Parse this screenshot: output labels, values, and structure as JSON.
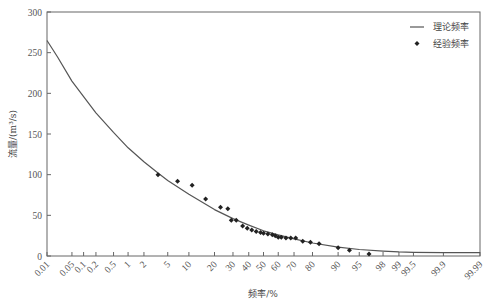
{
  "chart_data": {
    "type": "line+scatter",
    "title": "",
    "xlabel": "频率/%",
    "ylabel": "流量/(m³/s)",
    "x_scale": "probability (normal)",
    "ylim": [
      0,
      300
    ],
    "xlim": [
      0.01,
      99.99
    ],
    "grid": false,
    "legend_position": "top-right",
    "x_ticks": [
      0.01,
      0.05,
      0.1,
      0.2,
      0.5,
      1,
      2,
      5,
      10,
      20,
      30,
      40,
      50,
      60,
      70,
      80,
      90,
      95,
      98,
      99,
      99.5,
      99.9,
      99.99
    ],
    "x_tick_labels": [
      "0.01",
      "0.05",
      "0.1",
      "0.2",
      "0.5",
      "1",
      "2",
      "5",
      "10",
      "20",
      "30",
      "40",
      "50",
      "60",
      "70",
      "80",
      "90",
      "95",
      "98",
      "99",
      "99.5",
      "99.9",
      "99.99"
    ],
    "y_ticks": [
      0,
      50,
      100,
      150,
      200,
      250,
      300
    ],
    "y_tick_labels": [
      "0",
      "50",
      "100",
      "150",
      "200",
      "250",
      "300"
    ],
    "series": [
      {
        "name": "理论频率",
        "type": "line",
        "x": [
          0.01,
          0.02,
          0.05,
          0.1,
          0.2,
          0.5,
          1,
          2,
          3.5,
          5,
          10,
          20,
          30,
          40,
          50,
          60,
          70,
          80,
          90,
          95,
          98,
          99,
          99.5,
          99.9,
          99.99
        ],
        "y": [
          265,
          245,
          215,
          196,
          176,
          152,
          133,
          116,
          102,
          93,
          76,
          57,
          46,
          38,
          31,
          26,
          21,
          16,
          11,
          8,
          6,
          5,
          4.5,
          4,
          4
        ]
      },
      {
        "name": "经验频率",
        "type": "scatter",
        "x": [
          3.5,
          7,
          11,
          16,
          23,
          27,
          29,
          32,
          36,
          39,
          42,
          45,
          48,
          50,
          53,
          56,
          58,
          60,
          62,
          65,
          68,
          71,
          75,
          79,
          83,
          90,
          93,
          96.5
        ],
        "y": [
          100,
          92,
          87,
          70,
          60,
          58,
          44,
          44,
          37,
          34,
          32,
          30,
          29,
          28,
          27,
          26,
          25,
          23,
          23,
          22,
          22,
          22,
          18,
          17,
          15,
          10,
          7,
          2.5
        ]
      }
    ],
    "legend": [
      {
        "label": "理论频率",
        "marker": "line"
      },
      {
        "label": "经验频率",
        "marker": "diamond"
      }
    ]
  },
  "colors": {
    "axis": "#666666",
    "line": "#555555",
    "marker": "#222222",
    "text": "#555555"
  },
  "layout": {
    "plot_left": 47,
    "plot_right": 480,
    "plot_top": 12,
    "plot_bottom": 256
  }
}
